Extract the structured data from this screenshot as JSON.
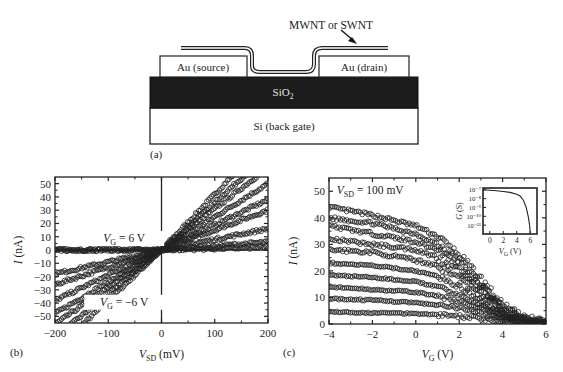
{
  "figure": {
    "panel_a": {
      "label": "(a)",
      "nanotube_label": "MWNT or SWNT",
      "source_label": "Au (source)",
      "drain_label": "Au (drain)",
      "oxide_label": "SiO",
      "oxide_sub": "2",
      "gate_label": "Si (back gate)"
    },
    "panel_b": {
      "label": "(b)"
    },
    "panel_c": {
      "label": "(c)"
    }
  },
  "chart_data": [
    {
      "panel": "b",
      "type": "scatter",
      "title": "",
      "xlabel": "V_SD (mV)",
      "xlabel_main": "V",
      "xlabel_sub": "SD",
      "xlabel_unit": " (mV)",
      "ylabel": "I (nA)",
      "ylabel_main": "I",
      "ylabel_unit": " (nA)",
      "xlim": [
        -200,
        200
      ],
      "ylim": [
        -55,
        55
      ],
      "xticks": [
        -200,
        -100,
        0,
        100,
        200
      ],
      "xtick_labels": [
        "−200",
        "−100",
        "0",
        "100",
        "200"
      ],
      "yticks": [
        50,
        40,
        30,
        20,
        10,
        0,
        -10,
        -20,
        -30,
        -40,
        -50
      ],
      "ytick_labels": [
        "50",
        "40",
        "30",
        "20",
        "10",
        "0",
        "−10",
        "−20",
        "−30",
        "−40",
        "−50"
      ],
      "annotations": [
        {
          "text_main": "V",
          "text_sub": "G",
          "text_rest": " = 6 V",
          "x": -70,
          "y": 6
        },
        {
          "text_main": "V",
          "text_sub": "G",
          "text_rest": " = −6 V",
          "x": -70,
          "y": -42
        }
      ],
      "grid": false,
      "series_note": "I-V curves at gate voltages from -6 V to 6 V; slope (conductance, nA/mV) decreasing with increasing V_G; V_G=6 V flat near zero",
      "series": [
        {
          "name": "V_G=-6 V",
          "slope_pos": 0.42,
          "slope_neg": 0.38
        },
        {
          "name": "V_G=-4.5 V",
          "slope_pos": 0.36,
          "slope_neg": 0.33
        },
        {
          "name": "V_G=-3 V",
          "slope_pos": 0.31,
          "slope_neg": 0.28
        },
        {
          "name": "V_G=-1.5 V",
          "slope_pos": 0.25,
          "slope_neg": 0.24
        },
        {
          "name": "V_G=0 V",
          "slope_pos": 0.19,
          "slope_neg": 0.19
        },
        {
          "name": "V_G=1.5 V",
          "slope_pos": 0.15,
          "slope_neg": 0.13
        },
        {
          "name": "V_G=3 V",
          "slope_pos": 0.08,
          "slope_neg": 0.09
        },
        {
          "name": "V_G=4.5 V",
          "slope_pos": 0.03,
          "slope_neg": 0.0
        },
        {
          "name": "V_G=6 V",
          "slope_pos": 0.01,
          "slope_neg": 0.0
        }
      ]
    },
    {
      "panel": "c",
      "type": "scatter",
      "title": "",
      "xlabel": "V_G (V)",
      "xlabel_main": "V",
      "xlabel_sub": "G",
      "xlabel_unit": " (V)",
      "ylabel": "I (nA)",
      "ylabel_main": "I",
      "ylabel_unit": " (nA)",
      "xlim": [
        -4,
        6
      ],
      "ylim": [
        0,
        55
      ],
      "xticks": [
        -4,
        -2,
        0,
        2,
        4,
        6
      ],
      "xtick_labels": [
        "−4",
        "−2",
        "0",
        "2",
        "4",
        "6"
      ],
      "yticks": [
        0,
        10,
        20,
        30,
        40,
        50
      ],
      "ytick_labels": [
        "0",
        "10",
        "20",
        "30",
        "40",
        "50"
      ],
      "annotations": [
        {
          "text_main": "V",
          "text_sub": "SD",
          "text_rest": " = 100 mV",
          "x": -2.1,
          "y": 49
        }
      ],
      "grid": false,
      "series_note": "I vs V_G at several temperatures/curves; current decreasing toward zero near V_G ~ 4-6 V",
      "series": [
        {
          "name": "curve 1",
          "x": [
            -4,
            -2,
            0,
            1,
            2,
            3,
            4,
            5,
            6
          ],
          "y": [
            44,
            41,
            37,
            33,
            26,
            17,
            7,
            2,
            0.5
          ]
        },
        {
          "name": "curve 2",
          "x": [
            -4,
            -2,
            0,
            1,
            2,
            3,
            4,
            5,
            6
          ],
          "y": [
            40,
            38,
            34,
            30,
            24,
            15,
            6,
            2,
            0.5
          ]
        },
        {
          "name": "curve 3",
          "x": [
            -4,
            -2,
            0,
            1,
            2,
            3,
            4,
            5,
            6
          ],
          "y": [
            37,
            34,
            31,
            28,
            22,
            14,
            5,
            1.5,
            0.5
          ]
        },
        {
          "name": "curve 4",
          "x": [
            -4,
            -2,
            0,
            1,
            2,
            3,
            4,
            5,
            6
          ],
          "y": [
            32,
            30,
            28,
            25,
            20,
            12,
            5,
            1.5,
            0.3
          ]
        },
        {
          "name": "curve 5",
          "x": [
            -4,
            -2,
            0,
            1,
            2,
            3,
            4,
            5,
            6
          ],
          "y": [
            28,
            27,
            24,
            22,
            17,
            11,
            4,
            1,
            0.3
          ]
        },
        {
          "name": "curve 6",
          "x": [
            -4,
            -2,
            0,
            1,
            2,
            3,
            4,
            5,
            6
          ],
          "y": [
            23,
            22,
            20,
            18,
            14,
            9,
            3.5,
            1,
            0.2
          ]
        },
        {
          "name": "curve 7",
          "x": [
            -4,
            -2,
            0,
            1,
            2,
            3,
            4,
            5,
            6
          ],
          "y": [
            18.5,
            17.5,
            16,
            14,
            11,
            7,
            3,
            1,
            0.2
          ]
        },
        {
          "name": "curve 8",
          "x": [
            -4,
            -2,
            0,
            1,
            2,
            3,
            4,
            5,
            6
          ],
          "y": [
            14,
            13,
            12,
            10.5,
            8.5,
            5.5,
            2.5,
            0.8,
            0.2
          ]
        },
        {
          "name": "curve 9",
          "x": [
            -4,
            -2,
            0,
            1,
            2,
            3,
            4,
            5,
            6
          ],
          "y": [
            9.5,
            9,
            8,
            7,
            6,
            4,
            2,
            0.6,
            0.1
          ]
        },
        {
          "name": "curve 10",
          "x": [
            -4,
            -2,
            0,
            1,
            2,
            3,
            4,
            5,
            6
          ],
          "y": [
            4.5,
            4.2,
            4,
            3.5,
            3,
            2,
            1,
            0.4,
            0.1
          ]
        }
      ],
      "inset": {
        "type": "line",
        "xlabel": "V_G (V)",
        "xlabel_main": "V",
        "xlabel_sub": "G",
        "xlabel_unit": " (V)",
        "ylabel": "G (S)",
        "ylabel_main": "G",
        "ylabel_unit": " (S)",
        "yscale": "log",
        "xlim": [
          -1,
          7
        ],
        "ylim_exp": [
          -12,
          -6.8
        ],
        "xticks": [
          0,
          2,
          4,
          6
        ],
        "xtick_labels": [
          "0",
          "2",
          "4",
          "6"
        ],
        "yticks_exp": [
          -7,
          -8,
          -9,
          -10,
          -11
        ],
        "ytick_labels": [
          "10⁻⁷",
          "10⁻⁸",
          "10⁻⁹",
          "10⁻¹⁰",
          "10⁻¹¹"
        ],
        "x": [
          -1,
          1,
          2,
          3,
          4,
          4.5,
          5,
          5.4,
          5.7,
          5.9,
          6.0
        ],
        "log10_y": [
          -7.0,
          -7.1,
          -7.2,
          -7.3,
          -7.5,
          -7.7,
          -8.2,
          -9.0,
          -10.0,
          -11.0,
          -12.0
        ]
      }
    }
  ]
}
